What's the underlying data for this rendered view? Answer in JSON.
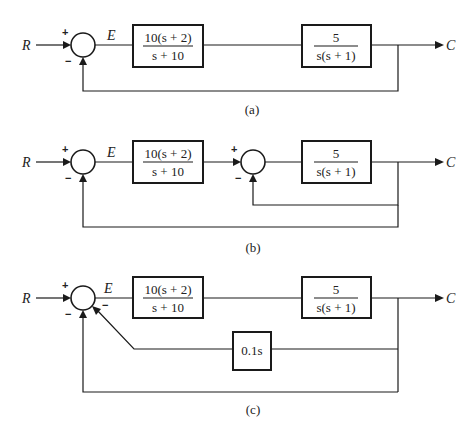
{
  "signals": {
    "input": "R",
    "error": "E",
    "output": "C"
  },
  "signs": {
    "plus": "+",
    "minus": "−"
  },
  "blocks": {
    "controller": {
      "num": "10(s + 2)",
      "den": "s + 10"
    },
    "plant": {
      "num": "5",
      "den": "s(s + 1)"
    },
    "rate_feedback": {
      "label": "0.1s"
    }
  },
  "captions": {
    "a": "(a)",
    "b": "(b)",
    "c": "(c)"
  },
  "colors": {
    "line": "#1a1a1a",
    "background": "#ffffff"
  }
}
